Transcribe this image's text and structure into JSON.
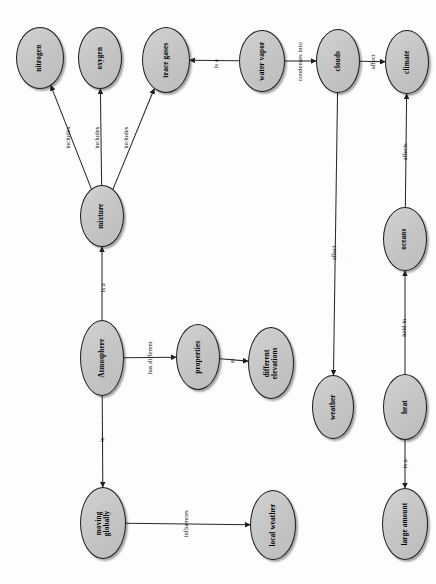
{
  "diagram": {
    "type": "concept-map",
    "orientation": "rotated-90-ccw",
    "background_color": "#fdfdfd",
    "node_fill_color": "#c9c9c9",
    "node_border_color": "#1c1c1c",
    "edge_color": "#2a2a2a",
    "nodes": [
      {
        "id": "nitrogen",
        "label": "nitrogen",
        "x": 16,
        "y": 27,
        "w": 48,
        "h": 62,
        "lines": 1
      },
      {
        "id": "oxygen",
        "label": "oxygen",
        "x": 78,
        "y": 27,
        "w": 44,
        "h": 62,
        "lines": 1
      },
      {
        "id": "trace_gases",
        "label": "trace gases",
        "x": 142,
        "y": 27,
        "w": 48,
        "h": 66,
        "lines": 1
      },
      {
        "id": "water_vapor",
        "label": "water vapor",
        "x": 239,
        "y": 30,
        "w": 46,
        "h": 62,
        "lines": 1
      },
      {
        "id": "clouds",
        "label": "clouds",
        "x": 316,
        "y": 29,
        "w": 44,
        "h": 64,
        "lines": 1
      },
      {
        "id": "climate",
        "label": "climate",
        "x": 385,
        "y": 30,
        "w": 44,
        "h": 64,
        "lines": 1
      },
      {
        "id": "mixture",
        "label": "mixture",
        "x": 80,
        "y": 185,
        "w": 44,
        "h": 62,
        "lines": 1
      },
      {
        "id": "oceans",
        "label": "oceans",
        "x": 383,
        "y": 207,
        "w": 44,
        "h": 64,
        "lines": 1
      },
      {
        "id": "atmosphere",
        "label": "Atmosphere",
        "x": 80,
        "y": 320,
        "w": 44,
        "h": 76,
        "lines": 1
      },
      {
        "id": "properties",
        "label": "properties",
        "x": 176,
        "y": 324,
        "w": 44,
        "h": 66,
        "lines": 1
      },
      {
        "id": "different_elevations",
        "label": "different elevations",
        "x": 248,
        "y": 327,
        "w": 46,
        "h": 72,
        "lines": 2
      },
      {
        "id": "weather",
        "label": "weather",
        "x": 312,
        "y": 375,
        "w": 42,
        "h": 64,
        "lines": 1
      },
      {
        "id": "heat",
        "label": "heat",
        "x": 383,
        "y": 374,
        "w": 44,
        "h": 66,
        "lines": 1
      },
      {
        "id": "moving_globally",
        "label": "moving globally",
        "x": 80,
        "y": 487,
        "w": 46,
        "h": 72,
        "lines": 2
      },
      {
        "id": "local_weather",
        "label": "local weather",
        "x": 250,
        "y": 490,
        "w": 46,
        "h": 70,
        "lines": 2
      },
      {
        "id": "large_amount",
        "label": "large amount",
        "x": 382,
        "y": 488,
        "w": 46,
        "h": 72,
        "lines": 2
      }
    ],
    "edges": [
      {
        "id": "e1",
        "from": "mixture",
        "to": "nitrogen",
        "label": "includes",
        "label_x": 68,
        "label_y": 138,
        "lines": 1
      },
      {
        "id": "e2",
        "from": "mixture",
        "to": "oxygen",
        "label": "includes",
        "label_x": 97,
        "label_y": 138,
        "lines": 1
      },
      {
        "id": "e3",
        "from": "mixture",
        "to": "trace_gases",
        "label": "includes",
        "label_x": 126,
        "label_y": 138,
        "lines": 1
      },
      {
        "id": "e4",
        "from": "water_vapor",
        "to": "trace_gases",
        "label": "is a",
        "label_x": 215,
        "label_y": 64,
        "lines": 1
      },
      {
        "id": "e5",
        "from": "water_vapor",
        "to": "clouds",
        "label": "condenses into",
        "label_x": 300,
        "label_y": 62,
        "lines": 2
      },
      {
        "id": "e6",
        "from": "clouds",
        "to": "climate",
        "label": "affect",
        "label_x": 372,
        "label_y": 62,
        "lines": 1
      },
      {
        "id": "e7",
        "from": "clouds",
        "to": "weather",
        "label": "affect",
        "label_x": 333,
        "label_y": 253,
        "lines": 1
      },
      {
        "id": "e8",
        "from": "oceans",
        "to": "climate",
        "label": "affects",
        "label_x": 404,
        "label_y": 152,
        "lines": 1
      },
      {
        "id": "e9",
        "from": "heat",
        "to": "oceans",
        "label": "held in",
        "label_x": 404,
        "label_y": 328,
        "lines": 1
      },
      {
        "id": "e10",
        "from": "heat",
        "to": "large_amount",
        "label": "is a",
        "label_x": 404,
        "label_y": 464,
        "lines": 1
      },
      {
        "id": "e11",
        "from": "atmosphere",
        "to": "mixture",
        "label": "is a",
        "label_x": 102,
        "label_y": 288,
        "lines": 1
      },
      {
        "id": "e12",
        "from": "atmosphere",
        "to": "properties",
        "label": "has different",
        "label_x": 149,
        "label_y": 358,
        "lines": 1
      },
      {
        "id": "e13",
        "from": "properties",
        "to": "different_elevations",
        "label": "at",
        "label_x": 231,
        "label_y": 361,
        "lines": 1
      },
      {
        "id": "e14",
        "from": "atmosphere",
        "to": "moving_globally",
        "label": "is",
        "label_x": 102,
        "label_y": 440,
        "lines": 1
      },
      {
        "id": "e15",
        "from": "moving_globally",
        "to": "local_weather",
        "label": "influences",
        "label_x": 185,
        "label_y": 524,
        "lines": 1
      }
    ]
  }
}
